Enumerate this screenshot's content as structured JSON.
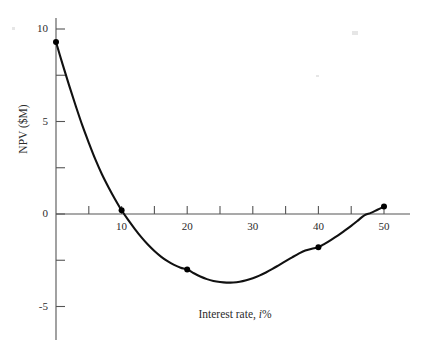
{
  "chart_data": {
    "type": "line",
    "title": "",
    "xlabel_prefix": "Interest rate, ",
    "xlabel_var": "i",
    "xlabel_suffix": "%",
    "xlabel": "Interest rate, i%",
    "ylabel": "NPV ($M)",
    "xlim": [
      -3,
      54
    ],
    "ylim": [
      -6.2,
      11.2
    ],
    "xticks_major": [
      10,
      20,
      30,
      40,
      50
    ],
    "xticks_minor": [
      5,
      15,
      25,
      35,
      45
    ],
    "xtick_labels": [
      "10",
      "20",
      "30",
      "40",
      "50"
    ],
    "yticks_major": [
      10,
      5,
      0,
      -5
    ],
    "yticks_minor": [
      7.5,
      2.5,
      -2.5
    ],
    "ytick_labels": [
      "10",
      "5",
      "0",
      "-5"
    ],
    "grid": false,
    "legend": false,
    "axis_color": "#555555",
    "curve_color": "#111111",
    "marker_color": "#000000",
    "background": "#ffffff",
    "x": [
      0,
      10,
      20,
      40,
      50
    ],
    "y": [
      9.3,
      0.2,
      -3.0,
      -1.8,
      0.4
    ],
    "markers": [
      {
        "x": 0,
        "y": 9.3
      },
      {
        "x": 10,
        "y": 0.2
      },
      {
        "x": 20,
        "y": -3.0
      },
      {
        "x": 40,
        "y": -1.8
      },
      {
        "x": 50,
        "y": 0.4
      }
    ],
    "curve_points": [
      {
        "x": 0,
        "y": 9.3
      },
      {
        "x": 1,
        "y": 8.1
      },
      {
        "x": 2,
        "y": 6.95
      },
      {
        "x": 3,
        "y": 5.85
      },
      {
        "x": 4,
        "y": 4.8
      },
      {
        "x": 5,
        "y": 3.85
      },
      {
        "x": 6,
        "y": 2.95
      },
      {
        "x": 7,
        "y": 2.15
      },
      {
        "x": 8,
        "y": 1.45
      },
      {
        "x": 9,
        "y": 0.8
      },
      {
        "x": 10,
        "y": 0.2
      },
      {
        "x": 11,
        "y": -0.32
      },
      {
        "x": 12,
        "y": -0.8
      },
      {
        "x": 13,
        "y": -1.25
      },
      {
        "x": 14,
        "y": -1.65
      },
      {
        "x": 15,
        "y": -2.0
      },
      {
        "x": 16,
        "y": -2.3
      },
      {
        "x": 17,
        "y": -2.55
      },
      {
        "x": 18,
        "y": -2.75
      },
      {
        "x": 19,
        "y": -2.9
      },
      {
        "x": 20,
        "y": -3.0
      },
      {
        "x": 21,
        "y": -3.2
      },
      {
        "x": 22,
        "y": -3.38
      },
      {
        "x": 23,
        "y": -3.52
      },
      {
        "x": 24,
        "y": -3.62
      },
      {
        "x": 25,
        "y": -3.68
      },
      {
        "x": 26,
        "y": -3.71
      },
      {
        "x": 27,
        "y": -3.7
      },
      {
        "x": 28,
        "y": -3.66
      },
      {
        "x": 29,
        "y": -3.58
      },
      {
        "x": 30,
        "y": -3.47
      },
      {
        "x": 31,
        "y": -3.33
      },
      {
        "x": 32,
        "y": -3.16
      },
      {
        "x": 33,
        "y": -2.97
      },
      {
        "x": 34,
        "y": -2.76
      },
      {
        "x": 35,
        "y": -2.55
      },
      {
        "x": 36,
        "y": -2.34
      },
      {
        "x": 37,
        "y": -2.14
      },
      {
        "x": 38,
        "y": -1.97
      },
      {
        "x": 39,
        "y": -1.88
      },
      {
        "x": 40,
        "y": -1.8
      },
      {
        "x": 41,
        "y": -1.6
      },
      {
        "x": 42,
        "y": -1.38
      },
      {
        "x": 43,
        "y": -1.15
      },
      {
        "x": 44,
        "y": -0.9
      },
      {
        "x": 45,
        "y": -0.64
      },
      {
        "x": 46,
        "y": -0.36
      },
      {
        "x": 47,
        "y": -0.07
      },
      {
        "x": 48,
        "y": 0.06
      },
      {
        "x": 49,
        "y": 0.23
      },
      {
        "x": 50,
        "y": 0.4
      }
    ],
    "minimum": {
      "x": 26.5,
      "y": -3.71
    },
    "zero_crossings": [
      10.4,
      47.3
    ]
  },
  "icons": {
    "marker": "filled-circle-marker"
  }
}
